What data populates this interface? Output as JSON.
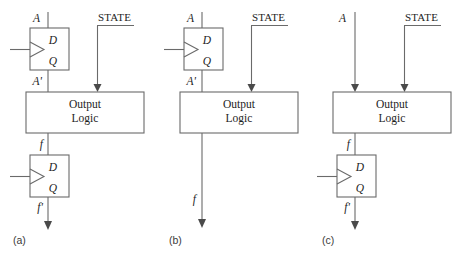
{
  "figure": {
    "colors": {
      "wire": "#6a6a6a",
      "arrow": "#4a4a4a",
      "text": "#1d1d1d",
      "panel_label": "#3a3a3a",
      "background": "#ffffff"
    },
    "block_label_line1": "Output",
    "block_label_line2": "Logic",
    "ff_input_label": "D",
    "ff_output_label": "Q"
  },
  "panels": [
    {
      "id": "a",
      "caption": "(a)",
      "input_signal": "A",
      "state_signal": "STATE",
      "ff_top_out": "A'",
      "block_out": "f",
      "ff_bottom_out": "f'",
      "has_input_flipflop": true,
      "has_output_flipflop": true
    },
    {
      "id": "b",
      "caption": "(b)",
      "input_signal": "A",
      "state_signal": "STATE",
      "ff_top_out": "A'",
      "block_out": "f",
      "has_input_flipflop": true,
      "has_output_flipflop": false
    },
    {
      "id": "c",
      "caption": "(c)",
      "input_signal": "A",
      "state_signal": "STATE",
      "block_out": "f",
      "ff_bottom_out": "f'",
      "has_input_flipflop": false,
      "has_output_flipflop": true
    }
  ]
}
